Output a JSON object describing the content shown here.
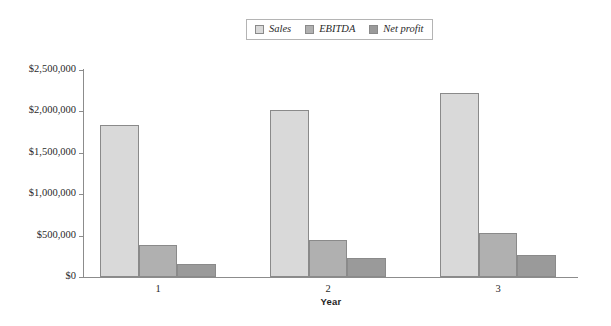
{
  "chart_data": {
    "type": "bar",
    "title": "",
    "xlabel": "Year",
    "ylabel": "",
    "categories": [
      "1",
      "2",
      "3"
    ],
    "series": [
      {
        "name": "Sales",
        "values": [
          1840000,
          2020000,
          2220000
        ],
        "color": "#d9d9d9"
      },
      {
        "name": "EBITDA",
        "values": [
          390000,
          450000,
          530000
        ],
        "color": "#b0b0b0"
      },
      {
        "name": "Net profit",
        "values": [
          160000,
          225000,
          270000
        ],
        "color": "#9a9a9a"
      }
    ],
    "ylim": [
      0,
      2500000
    ],
    "ytick_values": [
      0,
      500000,
      1000000,
      1500000,
      2000000,
      2500000
    ],
    "ytick_labels": [
      "$0",
      "$500,000",
      "$1,000,000",
      "$1,500,000",
      "$2,000,000",
      "$2,500,000"
    ],
    "grid": false,
    "legend_position": "top-center",
    "axis_color": "#8c8c8c",
    "bar_border_color": "#8a8a8a",
    "background": "#ffffff"
  }
}
